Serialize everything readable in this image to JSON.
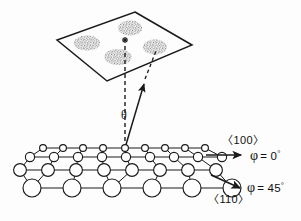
{
  "figure": {
    "type": "scientific-schematic"
  },
  "detection_plane": {
    "name": "diffraction-screen",
    "shape": "parallelogram",
    "vertices": [
      {
        "x": 135,
        "y": 12
      },
      {
        "x": 192,
        "y": 45
      },
      {
        "x": 107,
        "y": 81
      },
      {
        "x": 57,
        "y": 40
      }
    ],
    "spots": [
      {
        "id": "spot-top",
        "cx": 130,
        "cy": 28,
        "rx": 12,
        "ry": 7.5
      },
      {
        "id": "spot-left",
        "cx": 87,
        "cy": 43,
        "rx": 13,
        "ry": 7.5
      },
      {
        "id": "spot-right",
        "cx": 155,
        "cy": 47,
        "rx": 12,
        "ry": 7.5
      },
      {
        "id": "spot-bottom",
        "cx": 118,
        "cy": 57,
        "rx": 13.5,
        "ry": 8
      }
    ],
    "specular_marker": {
      "id": "specular-asterisk",
      "x": 125,
      "y": 40,
      "glyph": "*"
    }
  },
  "beams": {
    "origin": {
      "x": 125,
      "y": 148
    },
    "surface_normal": {
      "name": "surface-normal-dashed",
      "from": {
        "x": 125,
        "y": 148
      },
      "to": {
        "x": 125,
        "y": 40
      }
    },
    "scattered_beam_solid": {
      "name": "scattered-beam",
      "from": {
        "x": 125,
        "y": 148
      },
      "to": {
        "x": 143,
        "y": 80
      }
    },
    "scattered_beam_dashed_ext": {
      "name": "scattered-beam-extension",
      "from": {
        "x": 143,
        "y": 80
      },
      "to": {
        "x": 156,
        "y": 48
      }
    },
    "angle_label": {
      "symbol": "θ",
      "x": 123,
      "y": 118
    }
  },
  "crystal": {
    "name": "crystal-surface-lattice",
    "rows": [
      {
        "y": 148,
        "radius": 3.4,
        "x_positions": [
          43,
          63,
          83,
          103,
          125,
          145,
          165,
          185,
          205
        ]
      },
      {
        "y": 157,
        "radius": 4.6,
        "x_positions": [
          30,
          54,
          78,
          102,
          126,
          150,
          174,
          198,
          222
        ]
      },
      {
        "y": 170,
        "radius": 6.4,
        "x_positions": [
          20,
          48,
          76,
          104,
          132,
          160,
          188,
          216
        ]
      },
      {
        "y": 188,
        "radius": 9.0,
        "x_positions": [
          32,
          72,
          112,
          152,
          192,
          232
        ]
      }
    ]
  },
  "direction_labels": [
    {
      "id": "direction-100",
      "index_label": "〈100〉",
      "index_x": 222,
      "index_y": 143,
      "angle_symbol": "φ",
      "angle_value": "= 0",
      "angle_degree": "°",
      "angle_x": 252,
      "angle_y": 159,
      "arrow": {
        "x1": 206,
        "y1": 155,
        "x2": 243,
        "y2": 155
      }
    },
    {
      "id": "direction-110",
      "index_label": "〈110〉",
      "index_x": 214,
      "index_y": 201,
      "angle_symbol": "φ",
      "angle_value": "= 45",
      "angle_degree": "°",
      "angle_x": 248,
      "angle_y": 189,
      "arrow": {
        "x1": 212,
        "y1": 176,
        "x2": 241,
        "y2": 189
      }
    }
  ],
  "accent_colors": {
    "ink": "#1a1a1a",
    "background": "#ffffff",
    "spot_fill": "#8a8a8a"
  }
}
